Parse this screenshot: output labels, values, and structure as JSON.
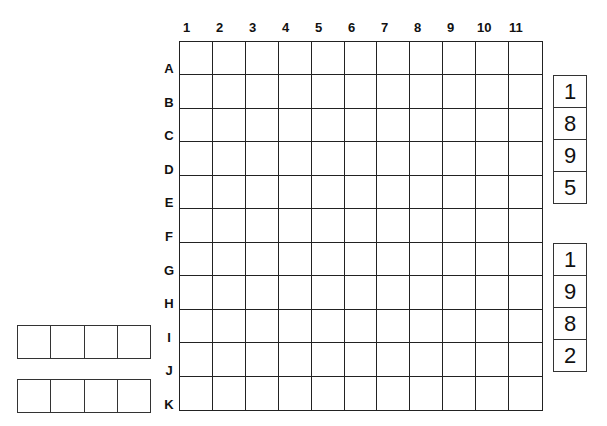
{
  "grid": {
    "columns": [
      "1",
      "2",
      "3",
      "4",
      "5",
      "6",
      "7",
      "8",
      "9",
      "10",
      "11"
    ],
    "rows": [
      "A",
      "B",
      "C",
      "D",
      "E",
      "F",
      "G",
      "H",
      "I",
      "J",
      "K"
    ]
  },
  "digit_sets": [
    {
      "digits": [
        "1",
        "8",
        "9",
        "5"
      ]
    },
    {
      "digits": [
        "1",
        "9",
        "8",
        "2"
      ]
    }
  ],
  "entry_rows": [
    {
      "cells": 4
    },
    {
      "cells": 4
    }
  ]
}
